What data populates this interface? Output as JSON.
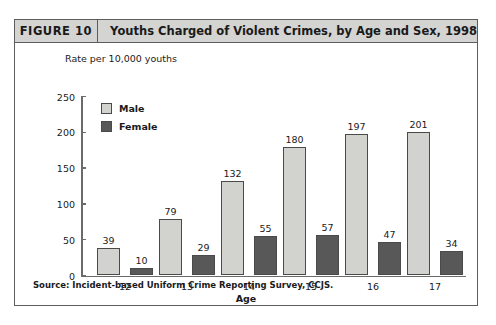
{
  "figure": {
    "number_label": "FIGURE 10",
    "title": "Youths Charged of Violent Crimes, by Age and Sex, 1998",
    "source": "Source:  Incident-based Uniform Crime Reporting Survey, CCJS."
  },
  "colors": {
    "male_bar": "#d2d2cf",
    "female_bar": "#585858",
    "bar_outline": "#4a4a4a",
    "header_band": "#d4d4d2",
    "frame_border": "#5d5d5d",
    "axis": "#6b6b6b"
  },
  "chart_data": {
    "type": "bar",
    "title": "Youths Charged of Violent Crimes, by Age and Sex, 1998",
    "xlabel": "Age",
    "ylabel": "Rate per 10,000 youths",
    "categories": [
      "12",
      "13",
      "14",
      "15",
      "16",
      "17"
    ],
    "series": [
      {
        "name": "Male",
        "values": [
          39,
          79,
          132,
          180,
          197,
          201
        ]
      },
      {
        "name": "Female",
        "values": [
          10,
          29,
          55,
          57,
          47,
          34
        ]
      }
    ],
    "ylim": [
      0,
      250
    ],
    "yticks": [
      0,
      50,
      100,
      150,
      200,
      250
    ],
    "ytick_labels": [
      "0",
      "50",
      "100",
      "150",
      "200",
      "250"
    ],
    "grid": false,
    "legend_position": "upper-left-inside"
  }
}
